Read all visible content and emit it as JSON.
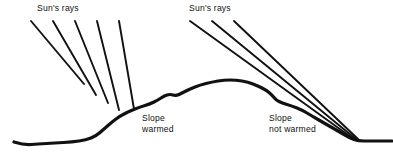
{
  "figure": {
    "background_color": "#ffffff",
    "ink_color": "#111111",
    "width": 393,
    "height": 159
  },
  "labels": {
    "sun_rays_left": "Sun's rays",
    "sun_rays_right": "Sun's rays",
    "slope_warmed_line1": "Slope",
    "slope_warmed_line2": "warmed",
    "slope_not_warmed_line1": "Slope",
    "slope_not_warmed_line2": "not warmed"
  },
  "diagram_data": {
    "type": "line-art-diagram",
    "subject": "solar insolation angle versus slope aspect",
    "ray_angle_degrees_from_horizontal": 50,
    "ray_direction": "down-and-to-the-right",
    "ray_groups": [
      {
        "name": "left-slope-rays",
        "count": 5,
        "incidence": "near-perpendicular",
        "outcome": "slope warmed",
        "rays": [
          {
            "x1": 31,
            "y1": 21,
            "x2": 84,
            "y2": 84
          },
          {
            "x1": 53,
            "y1": 21,
            "x2": 96,
            "y2": 95
          },
          {
            "x1": 75,
            "y1": 21,
            "x2": 108,
            "y2": 103
          },
          {
            "x1": 97,
            "y1": 21,
            "x2": 119,
            "y2": 110
          },
          {
            "x1": 119,
            "y1": 21,
            "x2": 134,
            "y2": 109
          }
        ]
      },
      {
        "name": "right-slope-rays",
        "count": 3,
        "incidence": "grazing / oblique",
        "outcome": "slope not warmed",
        "rays": [
          {
            "x1": 190,
            "y1": 21,
            "x2": 355,
            "y2": 140
          },
          {
            "x1": 212,
            "y1": 21,
            "x2": 357,
            "y2": 140
          },
          {
            "x1": 234,
            "y1": 21,
            "x2": 359,
            "y2": 140
          }
        ]
      }
    ],
    "terrain": {
      "name": "hill-profile",
      "stroke_width": 3.2,
      "points": [
        [
          14,
          142
        ],
        [
          24,
          145
        ],
        [
          38,
          144
        ],
        [
          55,
          143
        ],
        [
          72,
          142
        ],
        [
          86,
          140
        ],
        [
          96,
          136
        ],
        [
          104,
          129
        ],
        [
          112,
          122
        ],
        [
          120,
          116
        ],
        [
          130,
          111
        ],
        [
          140,
          107
        ],
        [
          150,
          104
        ],
        [
          158,
          100
        ],
        [
          164,
          96
        ],
        [
          170,
          94
        ],
        [
          176,
          96
        ],
        [
          182,
          93
        ],
        [
          190,
          89
        ],
        [
          200,
          85
        ],
        [
          212,
          82
        ],
        [
          224,
          80
        ],
        [
          236,
          80
        ],
        [
          248,
          82
        ],
        [
          258,
          86
        ],
        [
          266,
          90
        ],
        [
          272,
          95
        ],
        [
          276,
          100
        ],
        [
          282,
          103
        ],
        [
          292,
          106
        ],
        [
          302,
          110
        ],
        [
          312,
          116
        ],
        [
          324,
          123
        ],
        [
          338,
          131
        ],
        [
          350,
          138
        ],
        [
          358,
          141
        ],
        [
          370,
          141
        ],
        [
          382,
          141
        ],
        [
          392,
          141
        ]
      ]
    }
  }
}
